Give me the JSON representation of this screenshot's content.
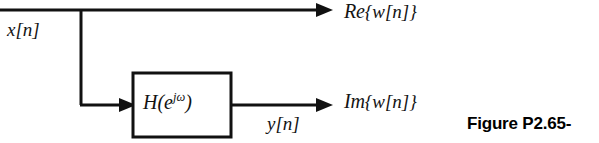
{
  "figure": {
    "caption": "Figure P2.65-",
    "background_color": "#ffffff",
    "line_color": "#111111"
  },
  "diagram": {
    "type": "block-diagram",
    "input_label": "x[n]",
    "intermediate_label": "y[n]",
    "block_label_base": "H(e",
    "block_label_exponent": "jω",
    "block_label_close": ")",
    "output_top_label": "Re {w[n]}",
    "output_bottom_label": "Im {w[n]}",
    "output_top_operator": "Re",
    "output_top_arg": "{w[n]}",
    "output_bottom_operator": "Im",
    "output_bottom_arg": "{w[n]}",
    "nodes": [
      {
        "id": "branch",
        "x": 80,
        "y": 10
      },
      {
        "id": "block",
        "x": 132,
        "y": 72,
        "width": 100,
        "height": 66
      }
    ],
    "wires": [
      {
        "id": "input-wire",
        "from": [
          0,
          10
        ],
        "to": [
          330,
          10
        ],
        "arrow": true
      },
      {
        "id": "branch-drop",
        "from": [
          80,
          10
        ],
        "to": [
          80,
          105
        ],
        "arrow": false
      },
      {
        "id": "block-input-wire",
        "from": [
          80,
          105
        ],
        "to": [
          132,
          105
        ],
        "arrow": true
      },
      {
        "id": "block-output-wire",
        "from": [
          232,
          105
        ],
        "to": [
          330,
          105
        ],
        "arrow": true
      }
    ]
  }
}
